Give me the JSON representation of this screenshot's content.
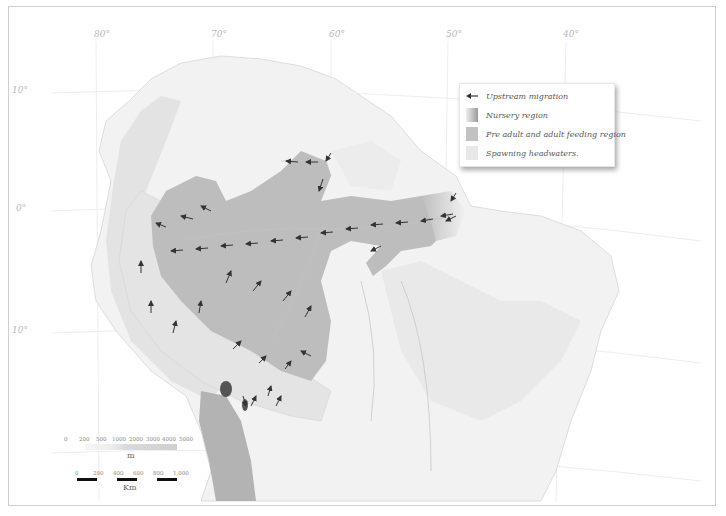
{
  "map": {
    "title": "",
    "longitude_labels": [
      {
        "label": "80°",
        "x": 93
      },
      {
        "label": "70°",
        "x": 210
      },
      {
        "label": "60°",
        "x": 328
      },
      {
        "label": "50°",
        "x": 445
      },
      {
        "label": "40°",
        "x": 562
      }
    ],
    "latitude_labels": [
      {
        "label": "10°",
        "y": 90
      },
      {
        "label": "0°",
        "y": 207
      },
      {
        "label": "10°",
        "y": 329
      }
    ],
    "colors": {
      "land": "#f4f4f4",
      "relief": "#e2e2e2",
      "rivers": "#c6c6c6",
      "feeding_region": "#b9b9b9",
      "spawning_headwaters": "#e6e6e6",
      "andes_dark": "#a8a8a8",
      "lakes": "#555555",
      "arrows": "#333333",
      "grid": "#e4e4e4"
    }
  },
  "legend": {
    "items": [
      {
        "label": "Upstream migration",
        "symbol": "arrow-left"
      },
      {
        "label": "Nursery region",
        "symbol": "gradient-swatch"
      },
      {
        "label": "Pre adult and adult feeding region",
        "symbol": "medium-gray-swatch"
      },
      {
        "label": "Spawning headwaters.",
        "symbol": "light-gray-swatch"
      }
    ]
  },
  "elevation_scale": {
    "ticks": [
      "0",
      "200",
      "500",
      "1000",
      "2000",
      "3000",
      "4000",
      "5000"
    ],
    "unit": "m"
  },
  "distance_scale": {
    "ticks": [
      "0",
      "200",
      "400",
      "600",
      "800",
      "1,000"
    ],
    "unit": "Km"
  }
}
